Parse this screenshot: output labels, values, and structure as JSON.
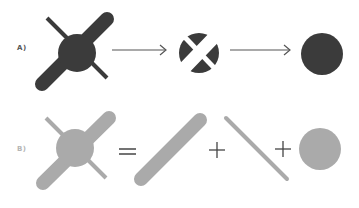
{
  "labels": {
    "a": "A)",
    "b": "B)"
  },
  "operators": {
    "equals": "=",
    "plus1": "+",
    "plus2": "+"
  },
  "colors": {
    "row_a": "#3b3b3b",
    "row_b": "#aaaaaa",
    "arrow": "#555555",
    "operator": "#444444",
    "background": "#ffffff"
  },
  "rows": [
    {
      "id": "A",
      "description": "Composite shape (circle + thick bar + thin line) is cut out of circle, resulting in a plain circle",
      "steps": [
        "composite-shape",
        "arrow",
        "circle-with-cutouts",
        "arrow",
        "plain-circle"
      ]
    },
    {
      "id": "B",
      "description": "Composite shape equals thick bar plus thin line plus circle",
      "steps": [
        "composite-shape",
        "equals",
        "thick-bar",
        "plus",
        "thin-line",
        "plus",
        "circle"
      ]
    }
  ]
}
